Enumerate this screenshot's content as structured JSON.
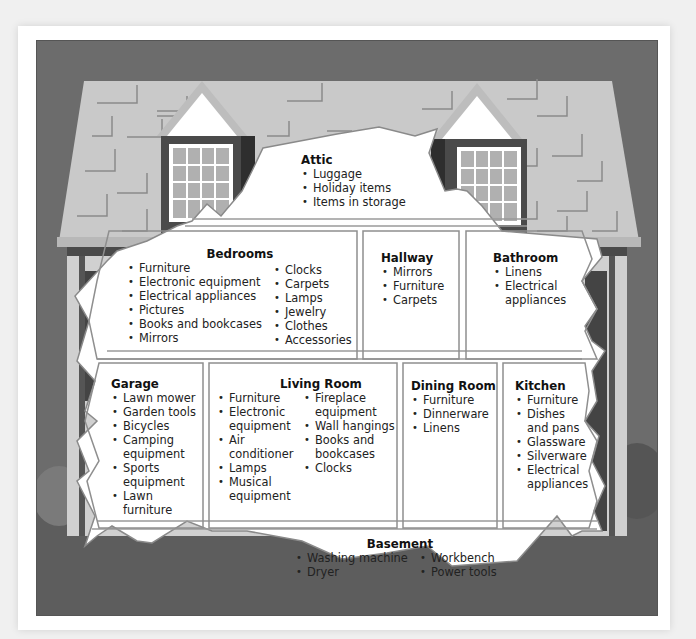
{
  "diagram": {
    "colors": {
      "sky": "#6e6e6e",
      "roof": "#c9c9c9",
      "shingle_lines": "#8a8a8a",
      "wall": "#d4d4d4",
      "trim": "#4a4a4a",
      "cutaway": "#ffffff",
      "room_border": "#9a9a9a",
      "ground": "#5f5f5f"
    }
  },
  "rooms": {
    "attic": {
      "title": "Attic",
      "items": [
        "Luggage",
        "Holiday items",
        "Items in storage"
      ]
    },
    "bedrooms": {
      "title": "Bedrooms",
      "items_col1": [
        "Furniture",
        "Electronic equipment",
        "Electrical appliances",
        "Pictures",
        "Books and bookcases",
        "Mirrors"
      ],
      "items_col2": [
        "Clocks",
        "Carpets",
        "Lamps",
        "Jewelry",
        "Clothes",
        "Accessories"
      ]
    },
    "hallway": {
      "title": "Hallway",
      "items": [
        "Mirrors",
        "Furniture",
        "Carpets"
      ]
    },
    "bathroom": {
      "title": "Bathroom",
      "items": [
        "Linens",
        "Electrical appliances"
      ]
    },
    "garage": {
      "title": "Garage",
      "items": [
        "Lawn mower",
        "Garden tools",
        "Bicycles",
        "Camping equipment",
        "Sports equipment",
        "Lawn furniture"
      ]
    },
    "living_room": {
      "title": "Living Room",
      "items_col1": [
        "Furniture",
        "Electronic equipment",
        "Air conditioner",
        "Lamps",
        "Musical equipment"
      ],
      "items_col2": [
        "Fireplace equipment",
        "Wall hangings",
        "Books and bookcases",
        "Clocks"
      ]
    },
    "dining_room": {
      "title": "Dining Room",
      "items": [
        "Furniture",
        "Dinnerware",
        "Linens"
      ]
    },
    "kitchen": {
      "title": "Kitchen",
      "items": [
        "Furniture",
        "Dishes and pans",
        "Glassware",
        "Silverware",
        "Electrical appliances"
      ]
    },
    "basement": {
      "title": "Basement",
      "items_col1": [
        "Washing machine",
        "Dryer"
      ],
      "items_col2": [
        "Workbench",
        "Power tools"
      ]
    }
  }
}
